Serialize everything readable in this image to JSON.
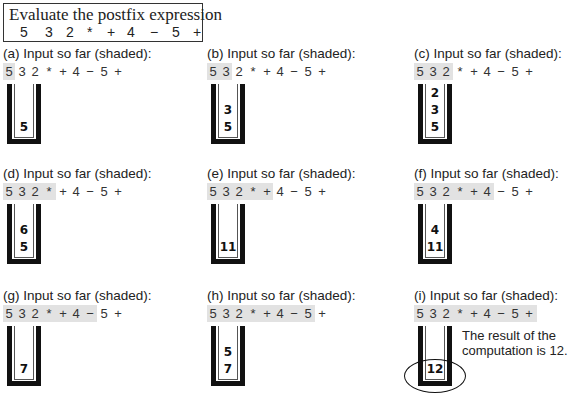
{
  "title": {
    "text": "Evaluate the postfix expression",
    "tokens": [
      "5",
      "3",
      "2",
      "*",
      "+",
      "4",
      "−",
      "5",
      "+"
    ]
  },
  "expression_tokens": [
    "5",
    "3",
    "2",
    "*",
    "+",
    "4",
    "−",
    "5",
    "+"
  ],
  "panels": [
    {
      "id": "a",
      "caption": "(a) Input so far (shaded):",
      "shaded_count": 1,
      "stack": [
        "5"
      ]
    },
    {
      "id": "b",
      "caption": "(b) Input so far (shaded):",
      "shaded_count": 2,
      "stack": [
        "5",
        "3"
      ]
    },
    {
      "id": "c",
      "caption": "(c) Input so far (shaded):",
      "shaded_count": 3,
      "stack": [
        "5",
        "3",
        "2"
      ]
    },
    {
      "id": "d",
      "caption": "(d) Input so far (shaded):",
      "shaded_count": 4,
      "stack": [
        "5",
        "6"
      ]
    },
    {
      "id": "e",
      "caption": "(e) Input so far (shaded):",
      "shaded_count": 5,
      "stack": [
        "11"
      ]
    },
    {
      "id": "f",
      "caption": "(f) Input so far (shaded):",
      "shaded_count": 6,
      "stack": [
        "11",
        "4"
      ]
    },
    {
      "id": "g",
      "caption": "(g) Input so far (shaded):",
      "shaded_count": 7,
      "stack": [
        "7"
      ]
    },
    {
      "id": "h",
      "caption": "(h) Input so far (shaded):",
      "shaded_count": 8,
      "stack": [
        "7",
        "5"
      ]
    },
    {
      "id": "i",
      "caption": "(i) Input so far (shaded):",
      "shaded_count": 9,
      "stack": [
        "12"
      ],
      "highlight_result": true,
      "note": "The result of the computation is 12."
    }
  ]
}
